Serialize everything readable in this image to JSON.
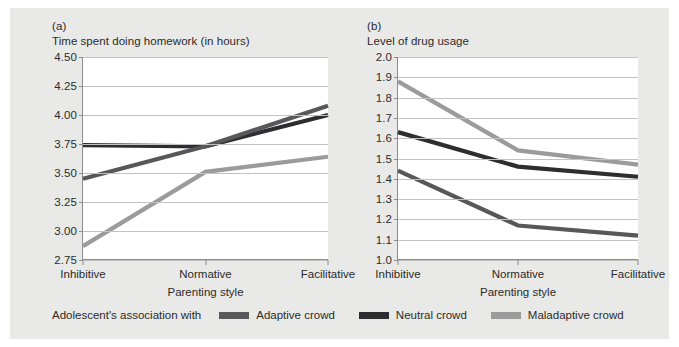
{
  "figure": {
    "background_color": "#e9e9e7",
    "plot_background_color": "#ffffff",
    "gridline_color": "#c2c2c2",
    "axis_color": "#8c8c8c"
  },
  "legend": {
    "intro": "Adolescent's association with",
    "entries": [
      {
        "label": "Adaptive crowd",
        "color": "#58585a"
      },
      {
        "label": "Neutral crowd",
        "color": "#2e2e30"
      },
      {
        "label": "Maladaptive crowd",
        "color": "#9b9b9b"
      }
    ]
  },
  "panels": [
    {
      "letter": "(a)",
      "title": "Time spent doing homework (in hours)",
      "xlabel": "Parenting style"
    },
    {
      "letter": "(b)",
      "title": "Level of drug usage",
      "xlabel": "Parenting style"
    }
  ],
  "chart_data": [
    {
      "type": "line",
      "title": "Time spent doing homework (in hours)",
      "panel": "(a)",
      "xlabel": "Parenting style",
      "ylabel": "Time spent doing homework (in hours)",
      "categories": [
        "Inhibitive",
        "Normative",
        "Facilitative"
      ],
      "yticks": [
        2.75,
        3.0,
        3.25,
        3.5,
        3.75,
        4.0,
        4.25,
        4.5
      ],
      "ytick_labels": [
        "2.75",
        "3.00",
        "3.25",
        "3.50",
        "3.75",
        "4.00",
        "4.25",
        "4.50"
      ],
      "ylim": [
        2.75,
        4.5
      ],
      "grid": true,
      "legend_position": "bottom",
      "series": [
        {
          "name": "Adaptive crowd",
          "color": "#58585a",
          "values": [
            3.45,
            3.73,
            4.08
          ]
        },
        {
          "name": "Neutral crowd",
          "color": "#2e2e30",
          "values": [
            3.74,
            3.73,
            4.0
          ]
        },
        {
          "name": "Maladaptive crowd",
          "color": "#9b9b9b",
          "values": [
            2.87,
            3.51,
            3.64
          ]
        }
      ]
    },
    {
      "type": "line",
      "title": "Level of drug usage",
      "panel": "(b)",
      "xlabel": "Parenting style",
      "ylabel": "Level of drug usage",
      "categories": [
        "Inhibitive",
        "Normative",
        "Facilitative"
      ],
      "yticks": [
        1.0,
        1.1,
        1.2,
        1.3,
        1.4,
        1.5,
        1.6,
        1.7,
        1.8,
        1.9,
        2.0
      ],
      "ytick_labels": [
        "1.0",
        "1.1",
        "1.2",
        "1.3",
        "1.4",
        "1.5",
        "1.6",
        "1.7",
        "1.8",
        "1.9",
        "2.0"
      ],
      "ylim": [
        1.0,
        2.0
      ],
      "grid": true,
      "legend_position": "bottom",
      "series": [
        {
          "name": "Adaptive crowd",
          "color": "#58585a",
          "values": [
            1.44,
            1.17,
            1.12
          ]
        },
        {
          "name": "Neutral crowd",
          "color": "#2e2e30",
          "values": [
            1.63,
            1.46,
            1.41
          ]
        },
        {
          "name": "Maladaptive crowd",
          "color": "#9b9b9b",
          "values": [
            1.88,
            1.54,
            1.47
          ]
        }
      ]
    }
  ]
}
